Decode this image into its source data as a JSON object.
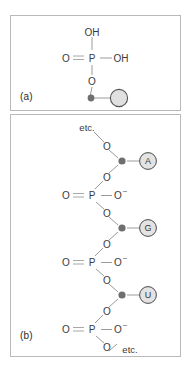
{
  "figure": {
    "panels": [
      {
        "id": "a",
        "label": "(a)",
        "atoms": {
          "oh_top": "OH",
          "o_left": "O",
          "p_center": "P",
          "oh_right": "OH",
          "o_bottom": "O"
        },
        "sugar_label": "",
        "base_label": ""
      },
      {
        "id": "b",
        "label": "(b)",
        "etc_top": "etc.",
        "etc_bottom": "etc.",
        "atoms": {
          "o": "O",
          "p": "P",
          "charge": "–"
        },
        "bases": [
          {
            "letter": "A"
          },
          {
            "letter": "G"
          },
          {
            "letter": "U"
          }
        ]
      }
    ]
  },
  "colors": {
    "panel_border": "#b9b9b9",
    "bond": "#9b9b9b",
    "atom_text": "#3a3a3a",
    "sugar_dot": "#6f6f6f",
    "base_fill": "#e3e3e3",
    "base_stroke": "#4a4a4a",
    "label_text": "#2b2b2b",
    "background": "#ffffff"
  }
}
